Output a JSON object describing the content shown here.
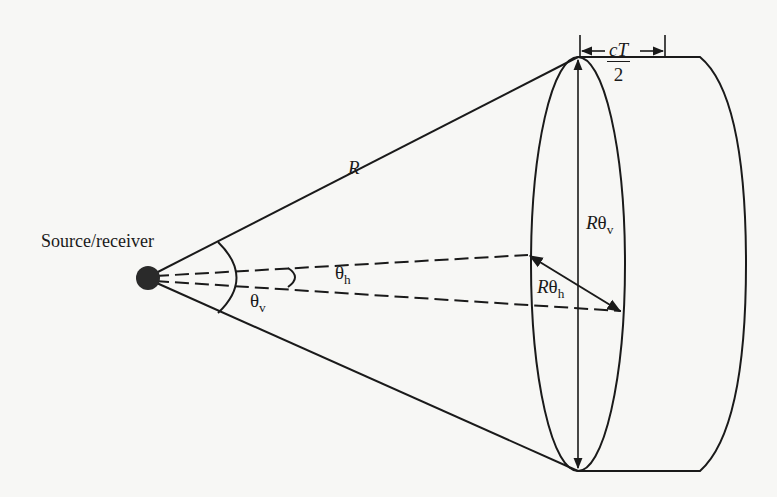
{
  "diagram": {
    "title": "",
    "labels": {
      "source": "Source/receiver",
      "range": "R",
      "theta_v_symbol": "θ",
      "theta_v_sub": "v",
      "theta_h_symbol": "θ",
      "theta_h_sub": "h",
      "r_theta_v_prefix": "R",
      "r_theta_v_symbol": "θ",
      "r_theta_v_sub": "v",
      "r_theta_h_prefix": "R",
      "r_theta_h_symbol": "θ",
      "r_theta_h_sub": "h",
      "depth_numerator": "cT",
      "depth_denominator": "2"
    },
    "colors": {
      "background": "#f7f7f5",
      "ink": "#1a1a1a"
    },
    "nodes": [
      {
        "id": "source",
        "shape": "filled-circle",
        "label": "Source/receiver"
      },
      {
        "id": "beam-cross-section",
        "shape": "ellipse",
        "label": "Rθv × Rθh"
      },
      {
        "id": "resolution-cell",
        "shape": "cylinder-slab",
        "label": "depth cT/2"
      }
    ],
    "edges": [
      {
        "from": "source",
        "to": "beam-cross-section",
        "style": "solid",
        "label": "R"
      },
      {
        "from": "source",
        "to": "beam-cross-section",
        "style": "dashed",
        "label": "θh"
      }
    ]
  }
}
